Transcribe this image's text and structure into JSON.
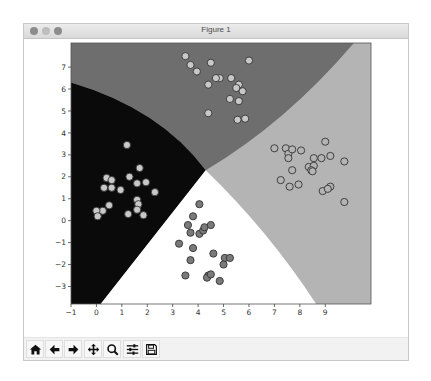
{
  "window": {
    "title": "Figure 1",
    "buttons": [
      "close",
      "minimize",
      "zoom"
    ]
  },
  "toolbar": {
    "buttons": [
      {
        "name": "home-button",
        "icon": "home-icon",
        "label": "Home"
      },
      {
        "name": "back-button",
        "icon": "arrow-left-icon",
        "label": "Back"
      },
      {
        "name": "forward-button",
        "icon": "arrow-right-icon",
        "label": "Forward"
      },
      {
        "name": "pan-button",
        "icon": "move-icon",
        "label": "Pan"
      },
      {
        "name": "zoom-button",
        "icon": "magnifier-icon",
        "label": "Zoom"
      },
      {
        "name": "configure-button",
        "icon": "sliders-icon",
        "label": "Configure subplots"
      },
      {
        "name": "save-button",
        "icon": "floppy-disk-icon",
        "label": "Save"
      }
    ]
  },
  "chart_data": {
    "type": "scatter",
    "title": "",
    "xlabel": "",
    "ylabel": "",
    "xlim": [
      -1,
      10.8
    ],
    "ylim": [
      -3.8,
      8.1
    ],
    "xticks": [
      -1,
      0,
      1,
      2,
      3,
      4,
      5,
      6,
      7,
      8,
      9
    ],
    "yticks": [
      -3,
      -2,
      -1,
      0,
      1,
      2,
      3,
      4,
      5,
      6,
      7
    ],
    "grid": false,
    "legend": null,
    "regions": [
      {
        "name": "top-class",
        "color": "#6e6e6e"
      },
      {
        "name": "left-class",
        "color": "#0a0a0a"
      },
      {
        "name": "bottom-class",
        "color": "#ffffff"
      },
      {
        "name": "right-class",
        "color": "#b4b4b4"
      }
    ],
    "series": [
      {
        "name": "cluster-top",
        "fill": "#c8c8c8",
        "points": [
          [
            3.5,
            7.5
          ],
          [
            3.7,
            7.1
          ],
          [
            3.95,
            6.8
          ],
          [
            4.5,
            7.2
          ],
          [
            4.4,
            6.2
          ],
          [
            4.85,
            6.5
          ],
          [
            5.3,
            6.5
          ],
          [
            5.6,
            6.2
          ],
          [
            5.75,
            5.9
          ],
          [
            5.5,
            6.05
          ],
          [
            5.25,
            5.55
          ],
          [
            5.6,
            5.45
          ],
          [
            5.55,
            4.6
          ],
          [
            5.85,
            4.65
          ],
          [
            4.4,
            4.9
          ],
          [
            6.0,
            7.3
          ],
          [
            4.7,
            6.5
          ]
        ]
      },
      {
        "name": "cluster-left",
        "fill": "#c8c8c8",
        "points": [
          [
            1.2,
            3.45
          ],
          [
            1.7,
            2.4
          ],
          [
            0.4,
            1.95
          ],
          [
            0.6,
            1.85
          ],
          [
            1.3,
            2.0
          ],
          [
            1.6,
            1.7
          ],
          [
            1.95,
            1.75
          ],
          [
            0.3,
            1.5
          ],
          [
            0.6,
            1.5
          ],
          [
            0.95,
            1.4
          ],
          [
            2.3,
            1.3
          ],
          [
            1.6,
            0.95
          ],
          [
            1.65,
            0.75
          ],
          [
            0.5,
            0.7
          ],
          [
            1.6,
            0.5
          ],
          [
            1.85,
            0.25
          ],
          [
            1.25,
            0.3
          ],
          [
            0.25,
            0.45
          ],
          [
            0.0,
            0.45
          ],
          [
            0.05,
            0.2
          ]
        ]
      },
      {
        "name": "cluster-bottom",
        "fill": "#7a7a7a",
        "points": [
          [
            4.05,
            0.75
          ],
          [
            3.8,
            0.2
          ],
          [
            3.6,
            -0.2
          ],
          [
            3.7,
            -0.55
          ],
          [
            4.05,
            -0.6
          ],
          [
            4.2,
            -0.45
          ],
          [
            4.25,
            -0.3
          ],
          [
            4.5,
            -0.2
          ],
          [
            3.25,
            -1.05
          ],
          [
            3.8,
            -1.25
          ],
          [
            4.6,
            -1.5
          ],
          [
            3.7,
            -1.8
          ],
          [
            3.5,
            -2.5
          ],
          [
            4.4,
            -2.5
          ],
          [
            4.35,
            -2.6
          ],
          [
            5.05,
            -1.7
          ],
          [
            5.25,
            -1.7
          ],
          [
            5.0,
            -2.0
          ],
          [
            4.85,
            -2.75
          ],
          [
            4.5,
            -2.45
          ]
        ]
      },
      {
        "name": "cluster-right",
        "fill": "#b4b4b4",
        "points": [
          [
            7.0,
            3.3
          ],
          [
            7.45,
            3.3
          ],
          [
            7.55,
            3.05
          ],
          [
            7.7,
            3.25
          ],
          [
            7.55,
            2.85
          ],
          [
            8.05,
            3.2
          ],
          [
            9.0,
            3.6
          ],
          [
            8.55,
            2.85
          ],
          [
            8.85,
            2.85
          ],
          [
            9.2,
            2.95
          ],
          [
            9.75,
            2.7
          ],
          [
            8.35,
            2.45
          ],
          [
            8.55,
            2.5
          ],
          [
            8.45,
            2.3
          ],
          [
            8.5,
            2.25
          ],
          [
            7.7,
            2.3
          ],
          [
            7.25,
            1.85
          ],
          [
            7.6,
            1.55
          ],
          [
            7.95,
            1.65
          ],
          [
            8.9,
            1.35
          ],
          [
            9.2,
            1.55
          ],
          [
            9.1,
            1.45
          ],
          [
            9.75,
            0.85
          ]
        ]
      }
    ]
  }
}
